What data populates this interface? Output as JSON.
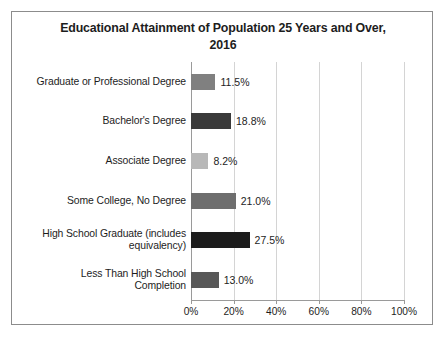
{
  "chart_data": {
    "type": "bar",
    "orientation": "horizontal",
    "title": "Educational Attainment of Population 25 Years and Over, 2016",
    "title_line1": "Educational Attainment of Population 25 Years and Over,",
    "title_line2": "2016",
    "xlabel": "",
    "ylabel": "",
    "xlim": [
      0,
      100
    ],
    "grid": true,
    "legend": "none",
    "categories": [
      "Graduate or Professional Degree",
      "Bachelor's Degree",
      "Associate Degree",
      "Some College, No Degree",
      "High School Graduate (includes equivalency)",
      "Less Than High School Completion"
    ],
    "values": [
      11.5,
      18.8,
      8.2,
      21.0,
      27.5,
      13.0
    ],
    "data_labels": [
      "11.5%",
      "18.8%",
      "8.2%",
      "21.0%",
      "27.5%",
      "13.0%"
    ],
    "bar_colors": [
      "#808080",
      "#3a3a3a",
      "#b8b8b8",
      "#6e6e6e",
      "#1c1c1c",
      "#585858"
    ],
    "xticks": [
      0,
      20,
      40,
      60,
      80,
      100
    ],
    "xtick_labels": [
      "0%",
      "20%",
      "40%",
      "60%",
      "80%",
      "100%"
    ]
  },
  "frame": {
    "border_color": "#8c8c8c",
    "background": "#ffffff"
  }
}
